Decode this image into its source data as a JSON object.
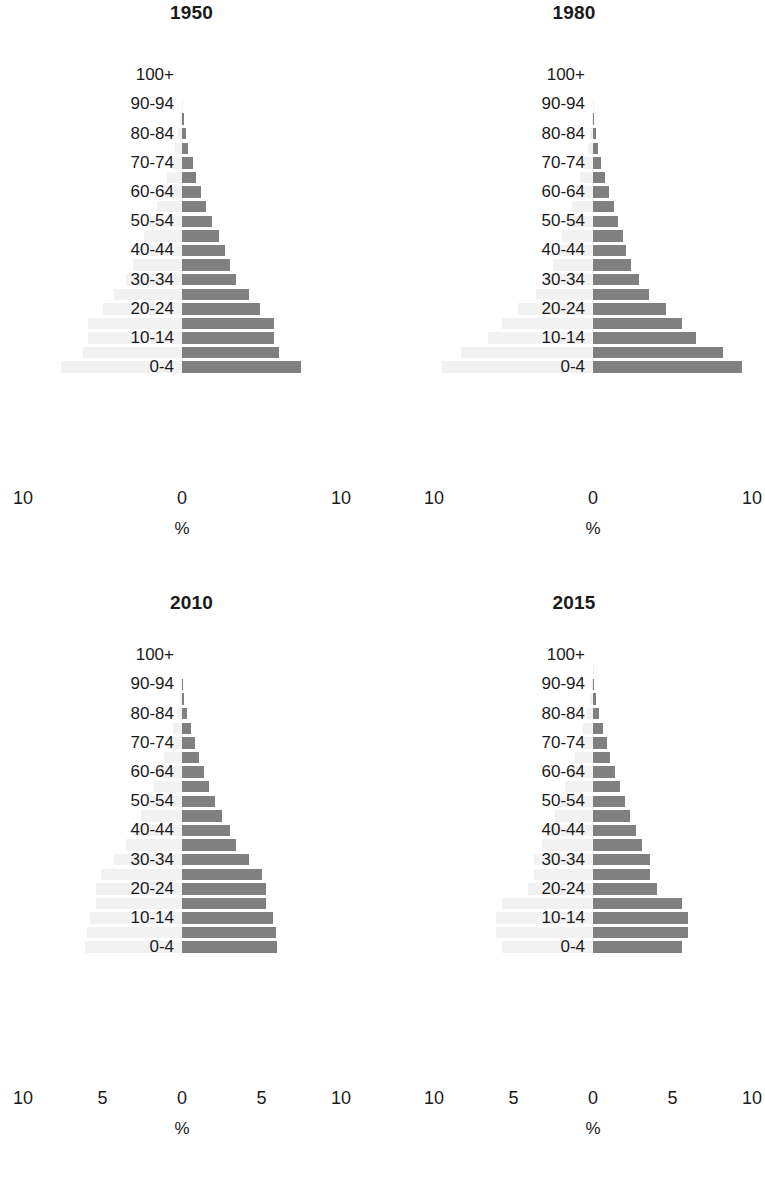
{
  "figure": {
    "axis_unit_label": "%",
    "bar_color_right": "#808080",
    "bar_color_left": "#f2f2f2",
    "age_groups": [
      "0-4",
      "5-9",
      "10-14",
      "15-19",
      "20-24",
      "25-29",
      "30-34",
      "35-39",
      "40-44",
      "45-49",
      "50-54",
      "55-59",
      "60-64",
      "65-69",
      "70-74",
      "75-79",
      "80-84",
      "85-89",
      "90-94",
      "95-99",
      "100+"
    ],
    "visible_age_labels": [
      "0-4",
      "10-14",
      "20-24",
      "30-34",
      "40-44",
      "50-54",
      "60-64",
      "70-74",
      "80-84",
      "90-94",
      "100+"
    ]
  },
  "chart_data": [
    {
      "type": "bar",
      "title": "1950",
      "xlabel": "%",
      "ylabel": "",
      "xlim": [
        -10,
        10
      ],
      "xticks": [
        -10,
        0,
        10
      ],
      "xticklabels": [
        "10",
        "0",
        "10"
      ],
      "grid": false,
      "legend": "none",
      "categories": [
        "0-4",
        "5-9",
        "10-14",
        "15-19",
        "20-24",
        "25-29",
        "30-34",
        "35-39",
        "40-44",
        "45-49",
        "50-54",
        "55-59",
        "60-64",
        "65-69",
        "70-74",
        "75-79",
        "80-84",
        "85-89",
        "90-94",
        "95-99",
        "100+"
      ],
      "series": [
        {
          "name": "right",
          "values": [
            7.5,
            6.1,
            5.8,
            5.8,
            4.9,
            4.2,
            3.4,
            3.0,
            2.7,
            2.3,
            1.9,
            1.5,
            1.2,
            0.9,
            0.7,
            0.4,
            0.25,
            0.1,
            0.03,
            0.0,
            0.0
          ]
        },
        {
          "name": "left",
          "values": [
            7.6,
            6.2,
            5.9,
            5.9,
            5.0,
            4.3,
            3.5,
            3.1,
            2.8,
            2.4,
            2.0,
            1.6,
            1.25,
            0.95,
            0.7,
            0.45,
            0.25,
            0.1,
            0.03,
            0.0,
            0.0
          ]
        }
      ]
    },
    {
      "type": "bar",
      "title": "1980",
      "xlabel": "%",
      "ylabel": "",
      "xlim": [
        -10,
        10
      ],
      "xticks": [
        -10,
        0,
        10
      ],
      "xticklabels": [
        "10",
        "0",
        "10"
      ],
      "grid": false,
      "legend": "none",
      "categories": [
        "0-4",
        "5-9",
        "10-14",
        "15-19",
        "20-24",
        "25-29",
        "30-34",
        "35-39",
        "40-44",
        "45-49",
        "50-54",
        "55-59",
        "60-64",
        "65-69",
        "70-74",
        "75-79",
        "80-84",
        "85-89",
        "90-94",
        "95-99",
        "100+"
      ],
      "series": [
        {
          "name": "right",
          "values": [
            9.4,
            8.2,
            6.5,
            5.6,
            4.6,
            3.5,
            2.9,
            2.4,
            2.1,
            1.9,
            1.6,
            1.3,
            1.0,
            0.75,
            0.5,
            0.3,
            0.16,
            0.07,
            0.02,
            0.0,
            0.0
          ]
        },
        {
          "name": "left",
          "values": [
            9.5,
            8.3,
            6.6,
            5.7,
            4.7,
            3.6,
            3.0,
            2.5,
            2.2,
            1.95,
            1.65,
            1.35,
            1.05,
            0.8,
            0.55,
            0.32,
            0.17,
            0.07,
            0.02,
            0.0,
            0.0
          ]
        }
      ]
    },
    {
      "type": "bar",
      "title": "2010",
      "xlabel": "%",
      "ylabel": "",
      "xlim": [
        -10,
        10
      ],
      "xticks": [
        -10,
        -5,
        0,
        5,
        10
      ],
      "xticklabels": [
        "10",
        "5",
        "0",
        "5",
        "10"
      ],
      "grid": false,
      "legend": "none",
      "categories": [
        "0-4",
        "5-9",
        "10-14",
        "15-19",
        "20-24",
        "25-29",
        "30-34",
        "35-39",
        "40-44",
        "45-49",
        "50-54",
        "55-59",
        "60-64",
        "65-69",
        "70-74",
        "75-79",
        "80-84",
        "85-89",
        "90-94",
        "95-99",
        "100+"
      ],
      "series": [
        {
          "name": "right",
          "values": [
            6.0,
            5.9,
            5.7,
            5.3,
            5.3,
            5.0,
            4.2,
            3.4,
            3.0,
            2.5,
            2.1,
            1.7,
            1.4,
            1.1,
            0.8,
            0.55,
            0.3,
            0.13,
            0.04,
            0.0,
            0.0
          ]
        },
        {
          "name": "left",
          "values": [
            6.1,
            6.0,
            5.8,
            5.4,
            5.4,
            5.1,
            4.3,
            3.5,
            3.1,
            2.6,
            2.2,
            1.75,
            1.45,
            1.15,
            0.85,
            0.58,
            0.32,
            0.14,
            0.04,
            0.0,
            0.0
          ]
        }
      ]
    },
    {
      "type": "bar",
      "title": "2015",
      "xlabel": "%",
      "ylabel": "",
      "xlim": [
        -10,
        10
      ],
      "xticks": [
        -10,
        -5,
        0,
        5,
        10
      ],
      "xticklabels": [
        "10",
        "5",
        "0",
        "5",
        "10"
      ],
      "grid": false,
      "legend": "none",
      "categories": [
        "0-4",
        "5-9",
        "10-14",
        "15-19",
        "20-24",
        "25-29",
        "30-34",
        "35-39",
        "40-44",
        "45-49",
        "50-54",
        "55-59",
        "60-64",
        "65-69",
        "70-74",
        "75-79",
        "80-84",
        "85-89",
        "90-94",
        "95-99",
        "100+"
      ],
      "series": [
        {
          "name": "right",
          "values": [
            5.6,
            6.0,
            6.0,
            5.6,
            4.0,
            3.6,
            3.6,
            3.1,
            2.7,
            2.3,
            2.0,
            1.7,
            1.4,
            1.1,
            0.85,
            0.6,
            0.35,
            0.16,
            0.05,
            0.01,
            0.0
          ]
        },
        {
          "name": "left",
          "values": [
            5.7,
            6.1,
            6.1,
            5.7,
            4.1,
            3.7,
            3.7,
            3.2,
            2.8,
            2.4,
            2.05,
            1.75,
            1.45,
            1.15,
            0.9,
            0.63,
            0.37,
            0.17,
            0.05,
            0.01,
            0.0
          ]
        }
      ]
    }
  ]
}
